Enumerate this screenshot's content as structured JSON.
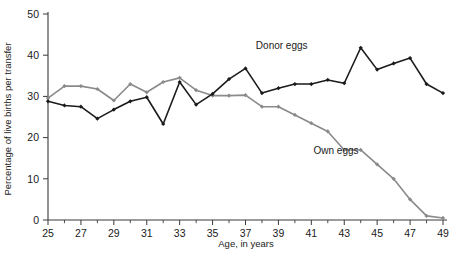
{
  "chart_data": {
    "type": "line",
    "title": "",
    "xlabel": "Age, in years",
    "ylabel": "Percentage of live births per transfer",
    "xlim": [
      25,
      49
    ],
    "ylim": [
      0,
      50
    ],
    "xticks": [
      25,
      27,
      29,
      31,
      33,
      35,
      37,
      39,
      41,
      43,
      45,
      47,
      49
    ],
    "xtick_labels": [
      "25",
      "27",
      "29",
      "31",
      "33",
      "35",
      "37",
      "39",
      "41",
      "43",
      "45",
      "47",
      "49"
    ],
    "yticks": [
      0,
      10,
      20,
      30,
      40,
      50
    ],
    "ytick_labels": [
      "0",
      "10",
      "20",
      "30",
      "40",
      "50"
    ],
    "minor_xticks": [
      26,
      28,
      30,
      32,
      34,
      36,
      38,
      40,
      42,
      44,
      46,
      48
    ],
    "grid": false,
    "legend_position": "inline-annotation",
    "x": [
      25,
      26,
      27,
      28,
      29,
      30,
      31,
      32,
      33,
      34,
      35,
      36,
      37,
      38,
      39,
      40,
      41,
      42,
      43,
      44,
      45,
      46,
      47,
      48,
      49
    ],
    "series": [
      {
        "name": "Donor eggs",
        "color": "#1b1b1b",
        "label_x": 39.2,
        "label_y": 41.5,
        "values": [
          28.8,
          27.8,
          27.5,
          24.6,
          26.8,
          28.8,
          29.8,
          27.2,
          33.5,
          28.0,
          30.6,
          34.2,
          36.8,
          33.0,
          30.5,
          34.2,
          33.4,
          36.0,
          35.2,
          34.0,
          34.8,
          33.3,
          35.0,
          38.2,
          38.4
        ]
      },
      {
        "name": "Own eggs",
        "color": "#8a8a8a",
        "label_x": 42.5,
        "label_y": 16.0,
        "values": [
          29.6,
          32.5,
          32.5,
          31.8,
          29.0,
          33.0,
          31.0,
          33.5,
          34.5,
          31.5,
          30.2,
          30.2,
          28.0,
          27.6,
          26.0,
          23.6,
          21.2,
          18.8,
          15.3,
          13.5,
          11.8,
          11.8,
          9.2,
          7.4,
          6.4
        ]
      }
    ]
  },
  "donor_display": {
    "x": [
      25,
      26,
      27,
      28,
      29,
      30,
      31,
      32,
      33,
      34,
      35,
      36,
      37,
      38,
      39,
      40,
      41,
      42,
      43,
      44,
      45,
      46,
      47,
      48,
      49
    ],
    "values": [
      28.8,
      27.8,
      27.5,
      24.6,
      26.8,
      28.8,
      29.8,
      23.3,
      33.5,
      28.0,
      30.6,
      34.2,
      36.8,
      30.8,
      32.0,
      33.0,
      33.0,
      34.0,
      33.2,
      41.8,
      36.5,
      38.0,
      39.3,
      33.0,
      30.8
    ]
  },
  "own_display": {
    "x": [
      25,
      26,
      27,
      28,
      29,
      30,
      31,
      32,
      33,
      34,
      35,
      36,
      37,
      38,
      39,
      40,
      41,
      42,
      43,
      44,
      45,
      46,
      47,
      48,
      49
    ],
    "values": [
      29.6,
      32.5,
      32.5,
      31.8,
      29.0,
      33.0,
      31.0,
      33.5,
      34.5,
      31.5,
      30.2,
      30.2,
      30.3,
      27.5,
      27.5,
      25.5,
      23.5,
      21.5,
      17.0,
      17.0,
      13.5,
      10.0,
      5.0,
      1.0,
      0.5
    ]
  },
  "labels": {
    "donor": "Donor eggs",
    "own": "Own eggs",
    "x_axis": "Age, in years",
    "y_axis": "Percentage of live births per transfer"
  }
}
